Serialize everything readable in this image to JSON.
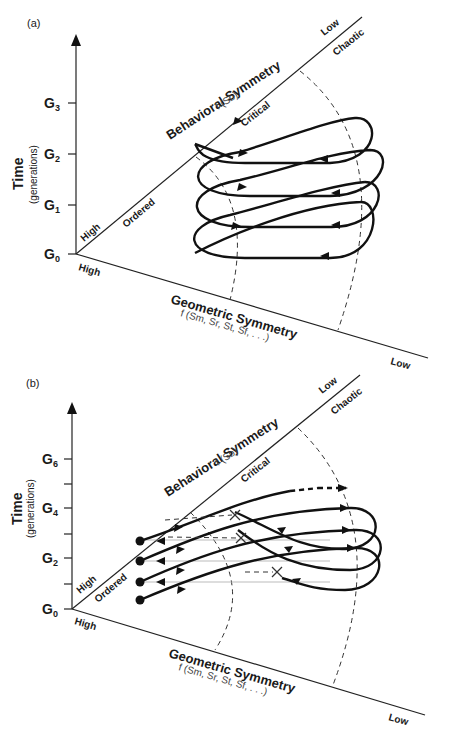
{
  "figure": {
    "panels": [
      {
        "id": "a",
        "label": "(a)",
        "y_axis": {
          "title": "Time",
          "subtitle": "(generations)",
          "ticks": [
            {
              "main": "G",
              "sub": "0"
            },
            {
              "main": "G",
              "sub": "1"
            },
            {
              "main": "G",
              "sub": "2"
            },
            {
              "main": "G",
              "sub": "3"
            }
          ]
        },
        "behavioral_axis": {
          "title": "Behavioral Symmetry",
          "function": "f (Sb)",
          "start_label": "High",
          "end_label": "Low",
          "regions": [
            "Ordered",
            "Critical",
            "Chaotic"
          ]
        },
        "geometric_axis": {
          "title": "Geometric Symmetry",
          "function": "f (Sm, Sr, St, Sf, . . .)",
          "start_label": "High",
          "end_label": "Low"
        },
        "trajectory": "helical loop oscillating between ordered and chaotic regions, 4 turns"
      },
      {
        "id": "b",
        "label": "(b)",
        "y_axis": {
          "title": "Time",
          "subtitle": "(generations)",
          "ticks": [
            {
              "main": "G",
              "sub": "0"
            },
            {
              "main": "G",
              "sub": "2"
            },
            {
              "main": "G",
              "sub": "4"
            },
            {
              "main": "G",
              "sub": "6"
            }
          ]
        },
        "behavioral_axis": {
          "title": "Behavioral Symmetry",
          "function": "f (Sb)",
          "start_label": "High",
          "end_label": "Low",
          "regions": [
            "Ordered",
            "Critical",
            "Chaotic"
          ]
        },
        "geometric_axis": {
          "title": "Geometric Symmetry",
          "function": "f (Sm, Sr, St, Sf, . . .)",
          "start_label": "High",
          "end_label": "Low"
        },
        "trajectory": "lineages starting at dots in ordered region, looping into chaotic region, returning and terminating at X marks near critical boundary"
      }
    ]
  }
}
